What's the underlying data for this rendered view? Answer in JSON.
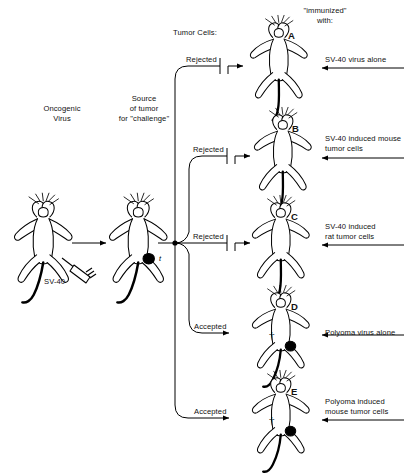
{
  "figure": {
    "type": "diagram",
    "background_color": "#ffffff",
    "ink_color": "#000000"
  },
  "headers": {
    "left_stage": "Oncogenic\nVirus",
    "middle_stage": "Source\nof tumor\nfor \"challenge\"",
    "outcome_column": "Tumor Cells:",
    "right_column": "\"immunized\"\nwith:"
  },
  "left_stage": {
    "inoculum_label": "SV-40",
    "icon": "mouse-dorsal"
  },
  "middle_stage": {
    "tumor_label": "t",
    "icon": "mouse-dorsal-with-tumor"
  },
  "rows": [
    {
      "id": "A",
      "letter": "A",
      "outcome": "Rejected",
      "blocked": true,
      "immunized_with": "SV-40 virus alone",
      "dead": false,
      "tumor": false
    },
    {
      "id": "B",
      "letter": "B",
      "outcome": "Rejected",
      "blocked": true,
      "immunized_with": "SV-40 induced mouse\ntumor cells",
      "dead": false,
      "tumor": false
    },
    {
      "id": "C",
      "letter": "C",
      "outcome": "Rejected",
      "blocked": true,
      "immunized_with": "SV-40 induced\nrat tumor cells",
      "dead": false,
      "tumor": false
    },
    {
      "id": "D",
      "letter": "D",
      "outcome": "Accepted",
      "blocked": false,
      "immunized_with": "Polyoma virus alone",
      "dead": true,
      "dead_symbol": "†",
      "tumor": true
    },
    {
      "id": "E",
      "letter": "E",
      "outcome": "Accepted",
      "blocked": false,
      "immunized_with": "Polyoma induced\nmouse tumor cells",
      "dead": true,
      "dead_symbol": "†",
      "tumor": true
    }
  ]
}
